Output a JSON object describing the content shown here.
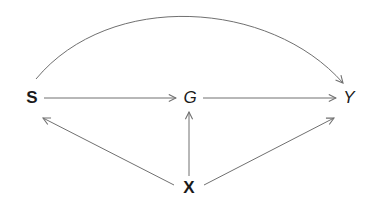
{
  "diagram": {
    "type": "causal-dag",
    "stroke_color": "#707070",
    "label_color": "#1a1a1a",
    "nodes": [
      {
        "id": "S",
        "label": "S",
        "x": 32,
        "y": 97,
        "style": "bold"
      },
      {
        "id": "G",
        "label": "G",
        "x": 190,
        "y": 97,
        "style": "italic"
      },
      {
        "id": "Y",
        "label": "Y",
        "x": 349,
        "y": 97,
        "style": "italic"
      },
      {
        "id": "X",
        "label": "X",
        "x": 189,
        "y": 186,
        "style": "bold"
      }
    ],
    "edges": [
      {
        "from": "S",
        "to": "Y",
        "shape": "curved"
      },
      {
        "from": "S",
        "to": "G",
        "shape": "straight"
      },
      {
        "from": "G",
        "to": "Y",
        "shape": "straight"
      },
      {
        "from": "X",
        "to": "S",
        "shape": "straight"
      },
      {
        "from": "X",
        "to": "G",
        "shape": "straight"
      },
      {
        "from": "X",
        "to": "Y",
        "shape": "straight"
      }
    ]
  }
}
